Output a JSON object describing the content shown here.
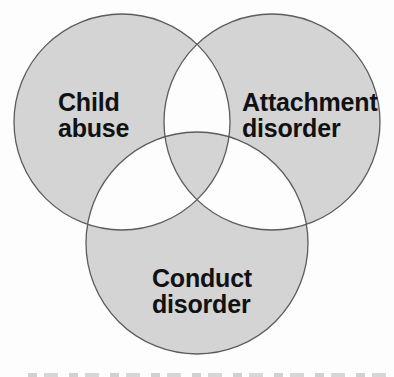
{
  "figure": {
    "kind": "venn-diagram",
    "sets": [
      {
        "id": "child-abuse",
        "label": "Child\nabuse"
      },
      {
        "id": "attachment-disorder",
        "label": "Attachment\ndisorder"
      },
      {
        "id": "conduct-disorder",
        "label": "Conduct\ndisorder"
      }
    ],
    "colors": {
      "region_fill": "#d4d4d4",
      "pairwise_overlap": "#ffffff",
      "outline": "#5c5c5c",
      "text": "#111111",
      "background": "#fdfdfd"
    }
  }
}
